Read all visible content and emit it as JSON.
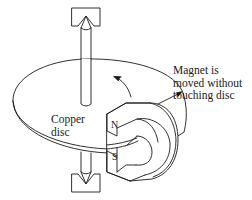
{
  "diagram": {
    "labels": {
      "magnet_line1": "Magnet is",
      "magnet_line2": "moved without",
      "magnet_line3": "touching disc",
      "copper_line1": "Copper",
      "copper_line2": "disc",
      "north_pole": "N",
      "south_pole": "S"
    },
    "components": [
      {
        "name": "copper-disc",
        "shape": "ellipse"
      },
      {
        "name": "axle",
        "shape": "vertical rod through disc center"
      },
      {
        "name": "top-bearing",
        "shape": "pointed pivot in cup"
      },
      {
        "name": "bottom-bearing",
        "shape": "pointed pivot in cup"
      },
      {
        "name": "horseshoe-magnet",
        "shape": "U-shape straddling disc rim"
      },
      {
        "name": "rotation-arrow",
        "direction": "counter-clockwise (viewed from above)"
      },
      {
        "name": "callout-arrow",
        "target": "horseshoe-magnet"
      }
    ],
    "colors": {
      "stroke": "#1a1a1a",
      "background": "#ffffff"
    }
  }
}
